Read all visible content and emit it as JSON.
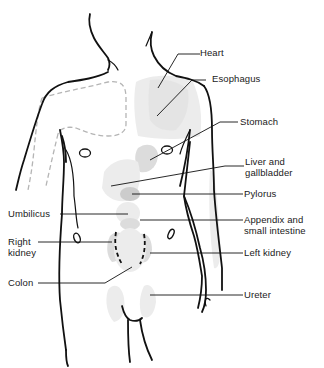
{
  "diagram": {
    "labels": {
      "heart": "Heart",
      "esophagus": "Esophagus",
      "stomach": "Stomach",
      "liver_line1": "Liver and",
      "liver_line2": "gallbladder",
      "pylorus": "Pylorus",
      "appendix_line1": "Appendix and",
      "appendix_line2": "small intestine",
      "left_kidney": "Left kidney",
      "ureter": "Ureter",
      "umbilicus": "Umbilicus",
      "right_kidney_line1": "Right",
      "right_kidney_line2": "kidney",
      "colon": "Colon"
    },
    "colors": {
      "outline": "#111111",
      "zone_light": "#ececec",
      "zone_mid": "#dcdcdc",
      "zone_dark": "#cccccc",
      "dashed_referral": "#b5b5b5"
    }
  }
}
